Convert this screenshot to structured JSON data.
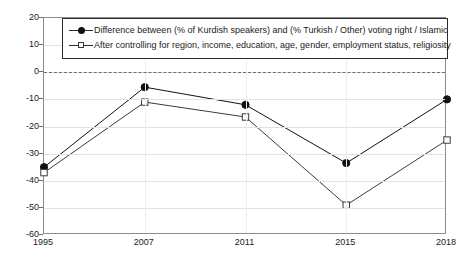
{
  "chart_data": {
    "type": "line",
    "title": "",
    "subtitle": "",
    "xlabel": "",
    "ylabel": "",
    "categories": [
      "1995",
      "2007",
      "2011",
      "2015",
      "2018"
    ],
    "ylim": [
      -60,
      20
    ],
    "ytick_labels": [
      "20",
      "10",
      "0",
      "-10",
      "-20",
      "-30",
      "-40",
      "-50",
      "-60"
    ],
    "ytick_values": [
      20,
      10,
      0,
      -10,
      -20,
      -30,
      -40,
      -50,
      -60
    ],
    "grid": true,
    "legend_position": "top-center",
    "zero_reference_line": true,
    "series": [
      {
        "name": "Difference between (% of Kurdish speakers) and (% Turkish / Other) voting right / Islamic",
        "marker": "filled-circle",
        "color": "#111111",
        "values": [
          -35,
          -5.5,
          -12,
          -33.5,
          -10
        ]
      },
      {
        "name": "After controlling for region, income, education, age, gender, employment status, religiosity",
        "marker": "open-square",
        "color": "#3a3a3a",
        "values": [
          -37,
          -11,
          -16.5,
          -49,
          -25
        ]
      }
    ]
  },
  "legend": {
    "items": [
      {
        "label": "Difference between (% of Kurdish speakers) and (% Turkish / Other) voting right / Islamic",
        "marker": "filled-circle"
      },
      {
        "label": "After controlling for region, income, education, age, gender, employment status, religiosity",
        "marker": "open-square"
      }
    ]
  },
  "colors": {
    "series_primary": "#111111",
    "series_secondary": "#3a3a3a",
    "frame": "#8c8c8c",
    "grid": "#e2e2e2",
    "zero_line": "#6e6e6e",
    "background": "#ffffff"
  }
}
